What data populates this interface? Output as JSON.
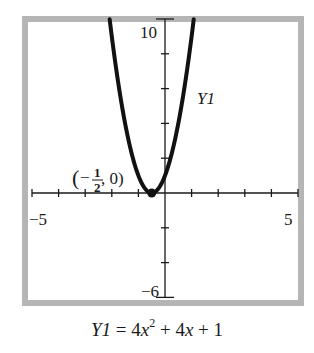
{
  "chart_data": {
    "type": "line",
    "title": "",
    "equation_label": "Y1",
    "caption": {
      "lhs": "Y1",
      "equals": "=",
      "term1_coef": "4",
      "term1_var": "x",
      "term1_exp": "2",
      "plus1": "+",
      "term2_coef": "4",
      "term2_var": "x",
      "plus2": "+",
      "constant": "1",
      "full_text": "Y1 = 4x^2 + 4x + 1"
    },
    "function": "4x^2 + 4x + 1",
    "series": [
      {
        "name": "Y1",
        "x": [
          -2.08,
          -2.0,
          -1.75,
          -1.5,
          -1.25,
          -1.0,
          -0.75,
          -0.5,
          -0.25,
          0.0,
          0.25,
          0.5,
          0.75,
          1.0,
          1.08
        ],
        "y": [
          10.0,
          9.0,
          6.25,
          4.0,
          2.25,
          1.0,
          0.25,
          0.0,
          0.25,
          1.0,
          2.25,
          4.0,
          6.25,
          9.0,
          10.0
        ]
      }
    ],
    "annotations": [
      {
        "type": "point",
        "x": -0.5,
        "y": 0,
        "label_open": "(",
        "label_minus": "−",
        "label_num": "1",
        "label_den": "2",
        "label_rest": ", 0)",
        "label_text": "(−1/2, 0)"
      }
    ],
    "xlim": [
      -5,
      5
    ],
    "ylim": [
      -6,
      10
    ],
    "xticks": [
      -5,
      -4,
      -3,
      -2,
      -1,
      0,
      1,
      2,
      3,
      4,
      5
    ],
    "yticks": [
      -6,
      -4,
      -2,
      0,
      2,
      4,
      6,
      8,
      10
    ],
    "tick_labels": {
      "xmin": "−5",
      "xmax": "5",
      "ymin": "−6",
      "ymax": "10"
    },
    "xlabel": "",
    "ylabel": "",
    "grid": false,
    "legend": "none"
  },
  "colors": {
    "frame": "#b5b5b5",
    "curve": "#111111",
    "axis": "#1a1a1a"
  }
}
